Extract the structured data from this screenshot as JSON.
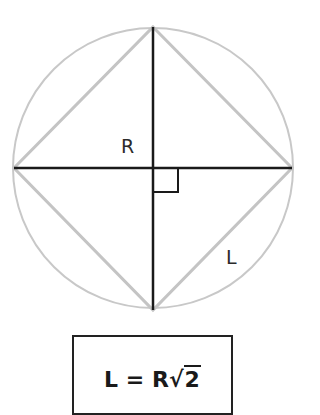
{
  "diagram": {
    "type": "inscribed-square-in-circle",
    "circle": {
      "cx": 153,
      "cy": 168,
      "r": 140,
      "stroke": "#c8c8c8"
    },
    "square_vertices": [
      [
        153,
        27
      ],
      [
        292,
        168
      ],
      [
        153,
        310
      ],
      [
        14,
        168
      ]
    ],
    "square_stroke": "#c8c8c8",
    "diameter_stroke": "#1a1a1a",
    "right_angle_marker": {
      "x": 153,
      "y": 168,
      "size": 25
    },
    "labels": {
      "radius": "R",
      "side": "L"
    }
  },
  "formula": {
    "lhs": "L",
    "equals": "=",
    "coef": "R",
    "sqrt_symbol": "√",
    "radicand": "2"
  }
}
